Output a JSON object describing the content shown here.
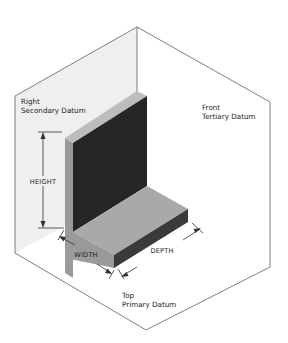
{
  "diagram": {
    "type": "isometric datum reference frame",
    "planes": {
      "right": {
        "line1": "Right",
        "line2": "Secondary Datum"
      },
      "front": {
        "line1": "Front",
        "line2": "Tertiary Datum"
      },
      "top": {
        "line1": "Top",
        "line2": "Primary Datum"
      }
    },
    "dimensions": {
      "height": "HEIGHT",
      "width": "WIDTH",
      "depth": "DEPTH"
    },
    "colors": {
      "plane_right": "#eeeeee",
      "plane_front": "#ffffff",
      "plane_top": "#ffffff",
      "frame_line": "#666666",
      "block_top_face": "#b9b9b9",
      "block_side_face": "#8f8f8f",
      "block_dark_face": "#262626",
      "block_foot_top": "#a6a6a6",
      "block_foot_front": "#3a3a3a"
    }
  }
}
